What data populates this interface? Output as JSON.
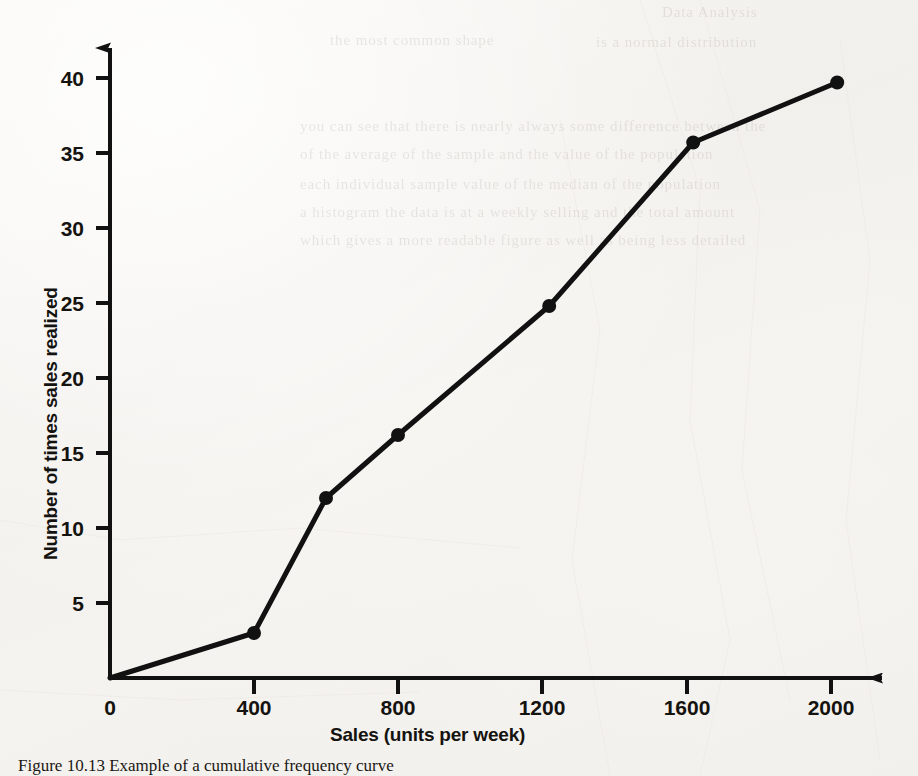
{
  "figure": {
    "caption": "Figure 10.13 Example of a cumulative frequency curve",
    "caption_visible_fragment": "Figure 10.13 Example of a cumu"
  },
  "chart_data": {
    "type": "line",
    "title": "",
    "subtitle": "",
    "xlabel": "Sales (units per week)",
    "ylabel": "Number of times sales realized",
    "xlim": [
      0,
      2100
    ],
    "ylim": [
      0,
      42
    ],
    "xticks": [
      0,
      400,
      800,
      1200,
      1600,
      2000
    ],
    "xticklabels": [
      "0",
      "400",
      "800",
      "1200",
      "1600",
      "2000"
    ],
    "yticks": [
      5,
      10,
      15,
      20,
      25,
      30,
      35,
      40
    ],
    "yticklabels": [
      "5",
      "10",
      "15",
      "20",
      "25",
      "30",
      "35",
      "40"
    ],
    "grid": false,
    "legend": false,
    "legend_position": "none",
    "marker": "filled-circle",
    "line_color": "#111111",
    "line_width_px": 5,
    "series": [
      {
        "name": "Cumulative sales frequency",
        "x": [
          0,
          400,
          600,
          800,
          1220,
          1620,
          2020
        ],
        "y": [
          0,
          3,
          12,
          16.2,
          24.8,
          35.7,
          39.7
        ],
        "points": [
          {
            "x": 0,
            "y": 0,
            "marker": false
          },
          {
            "x": 400,
            "y": 3,
            "marker": true
          },
          {
            "x": 600,
            "y": 12,
            "marker": true
          },
          {
            "x": 800,
            "y": 16.2,
            "marker": true
          },
          {
            "x": 1220,
            "y": 24.8,
            "marker": true
          },
          {
            "x": 1620,
            "y": 35.7,
            "marker": true
          },
          {
            "x": 2020,
            "y": 39.7,
            "marker": true
          }
        ]
      }
    ]
  },
  "axes": {
    "x_arrowhead": true,
    "y_arrowhead": true,
    "origin_label": "0"
  },
  "bleed_through_text": [
    "Data Analysis",
    "the most common  shape",
    "is a normal  distribution",
    "you can see that there is nearly always some difference between the",
    "of the average of the sample and the value of the population",
    "each individual sample value of the median  of the  population",
    "a histogram the data is at a weekly  selling and the total amount",
    "which gives a more readable  figure as  well  as being  less detailed"
  ],
  "colors": {
    "paper": "#f4f2ee",
    "ink": "#111111",
    "bleed": "#8a8378"
  }
}
